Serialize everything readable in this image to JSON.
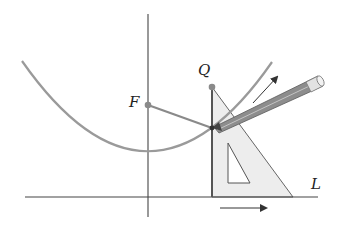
{
  "diagram": {
    "labels": {
      "focus": "F",
      "point_q": "Q",
      "directrix": "L"
    },
    "points": {
      "focus": {
        "x": 148,
        "y": 105
      },
      "q": {
        "x": 212,
        "y": 87
      },
      "contact": {
        "x": 212,
        "y": 128
      }
    },
    "colors": {
      "axis": "#555555",
      "curve": "#9a9a9a",
      "segment": "#8a8a8a",
      "set_square_fill": "#ededed",
      "pencil": "#7a7a7a",
      "arrow": "#333333"
    },
    "elements": [
      "vertical-axis",
      "directrix-line-L",
      "parabola",
      "focus-point-F",
      "point-Q",
      "segment-F-to-contact",
      "segment-Q-to-contact",
      "set-square",
      "pencil",
      "curve-direction-arrow",
      "slide-direction-arrow"
    ]
  }
}
